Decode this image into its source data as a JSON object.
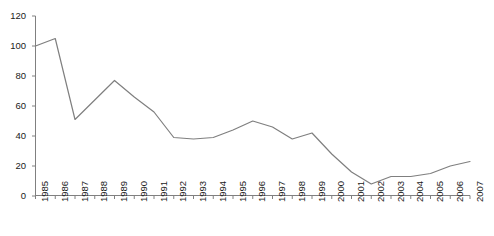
{
  "chart_data": {
    "type": "line",
    "title": "",
    "subtitle": "",
    "xlabel": "",
    "ylabel": "",
    "categories": [
      "1985",
      "1986",
      "1987",
      "1988",
      "1989",
      "1990",
      "1991",
      "1992",
      "1993",
      "1994",
      "1995",
      "1996",
      "1997",
      "1998",
      "1999",
      "2000",
      "2001",
      "2002",
      "2003",
      "2004",
      "2005",
      "2006",
      "2007"
    ],
    "values": [
      100,
      105,
      51,
      64,
      77,
      66,
      56,
      39,
      38,
      39,
      44,
      50,
      46,
      38,
      42,
      28,
      16,
      8,
      13,
      13,
      15,
      20,
      23
    ],
    "series": [
      {
        "name": "",
        "values": [
          100,
          105,
          51,
          64,
          77,
          66,
          56,
          39,
          38,
          39,
          44,
          50,
          46,
          38,
          42,
          28,
          16,
          8,
          13,
          13,
          15,
          20,
          23
        ],
        "color": "#7f7f7f"
      }
    ],
    "ylim": [
      0,
      120
    ],
    "yticks": [
      0,
      20,
      40,
      60,
      80,
      100,
      120
    ],
    "ytick_labels": [
      "0",
      "20",
      "40",
      "60",
      "80",
      "100",
      "120"
    ],
    "grid": false,
    "legend": false,
    "legend_position": "none",
    "axis_color": "#808080",
    "line_color": "#7f7f7f",
    "tick_label_color": "#1a1a1a",
    "x_labels_rotated": true
  }
}
